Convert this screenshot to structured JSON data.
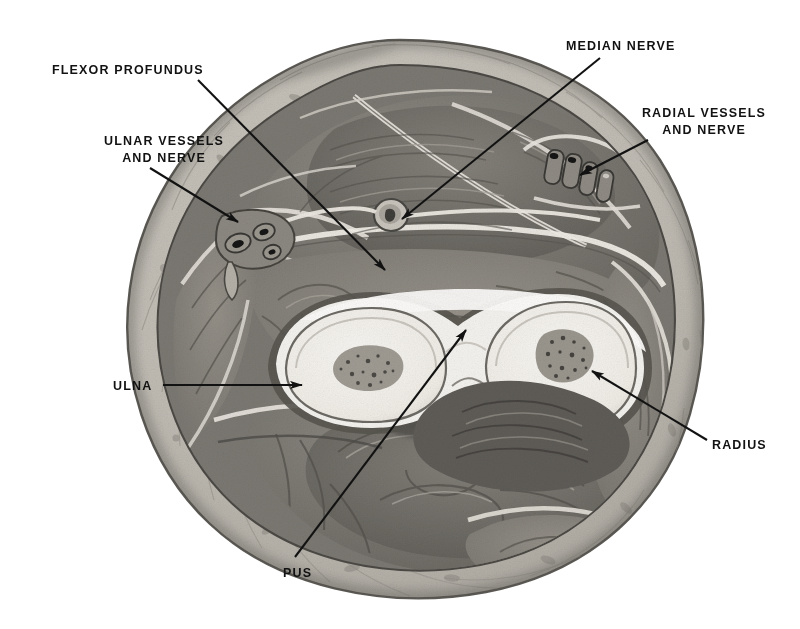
{
  "figure": {
    "kind": "anatomical-illustration",
    "background_color": "#ffffff",
    "ink_color": "#121212"
  },
  "palette": {
    "skin_edge": "#6f6c66",
    "subcutaneous_fat": "#c2beb6",
    "fascia_light": "#e9e6df",
    "muscle_mid": "#8b8881",
    "muscle_dark": "#6a6762",
    "muscle_darker": "#585550",
    "bone_cortex": "#f3f1ec",
    "bone_marrow": "#9a968e",
    "vessel_wall": "#8e8a83",
    "vessel_lumen": "#1d1c1a",
    "pus_fill": "#f4f2ee"
  },
  "labels": [
    {
      "id": "flexor-profundus",
      "lines": [
        "FLEXOR PROFUNDUS"
      ],
      "text": "FLEXOR PROFUNDUS",
      "x": 52,
      "y": 62,
      "align": "left",
      "leader": {
        "x1": 198,
        "y1": 80,
        "x2": 385,
        "y2": 270,
        "arrow": true
      }
    },
    {
      "id": "ulnar-vessels-and-nerve",
      "lines": [
        "ULNAR VESSELS",
        "AND NERVE"
      ],
      "text": "ULNAR VESSELS AND NERVE",
      "x": 48,
      "y": 133,
      "align": "center",
      "leader": {
        "x1": 150,
        "y1": 168,
        "x2": 238,
        "y2": 222,
        "arrow": true
      }
    },
    {
      "id": "median-nerve",
      "lines": [
        "MEDIAN NERVE"
      ],
      "text": "MEDIAN NERVE",
      "x": 566,
      "y": 38,
      "align": "left",
      "leader": {
        "x1": 600,
        "y1": 58,
        "x2": 402,
        "y2": 219,
        "arrow": true
      }
    },
    {
      "id": "radial-vessels-and-nerve",
      "lines": [
        "RADIAL VESSELS",
        "AND NERVE"
      ],
      "text": "RADIAL VESSELS AND NERVE",
      "x": 637,
      "y": 105,
      "align": "left",
      "leader": {
        "x1": 648,
        "y1": 140,
        "x2": 580,
        "y2": 175,
        "arrow": true
      }
    },
    {
      "id": "ulna",
      "lines": [
        "ULNA"
      ],
      "text": "ULNA",
      "x": 113,
      "y": 378,
      "align": "left",
      "leader": {
        "x1": 163,
        "y1": 385,
        "x2": 302,
        "y2": 385,
        "arrow": true
      }
    },
    {
      "id": "radius",
      "lines": [
        "RADIUS"
      ],
      "text": "RADIUS",
      "x": 712,
      "y": 437,
      "align": "left",
      "leader": {
        "x1": 707,
        "y1": 440,
        "x2": 592,
        "y2": 371,
        "arrow": true
      }
    },
    {
      "id": "pus",
      "lines": [
        "PUS"
      ],
      "text": "PUS",
      "x": 283,
      "y": 565,
      "align": "left",
      "leader": {
        "x1": 295,
        "y1": 557,
        "x2": 466,
        "y2": 330,
        "arrow": true
      }
    }
  ]
}
